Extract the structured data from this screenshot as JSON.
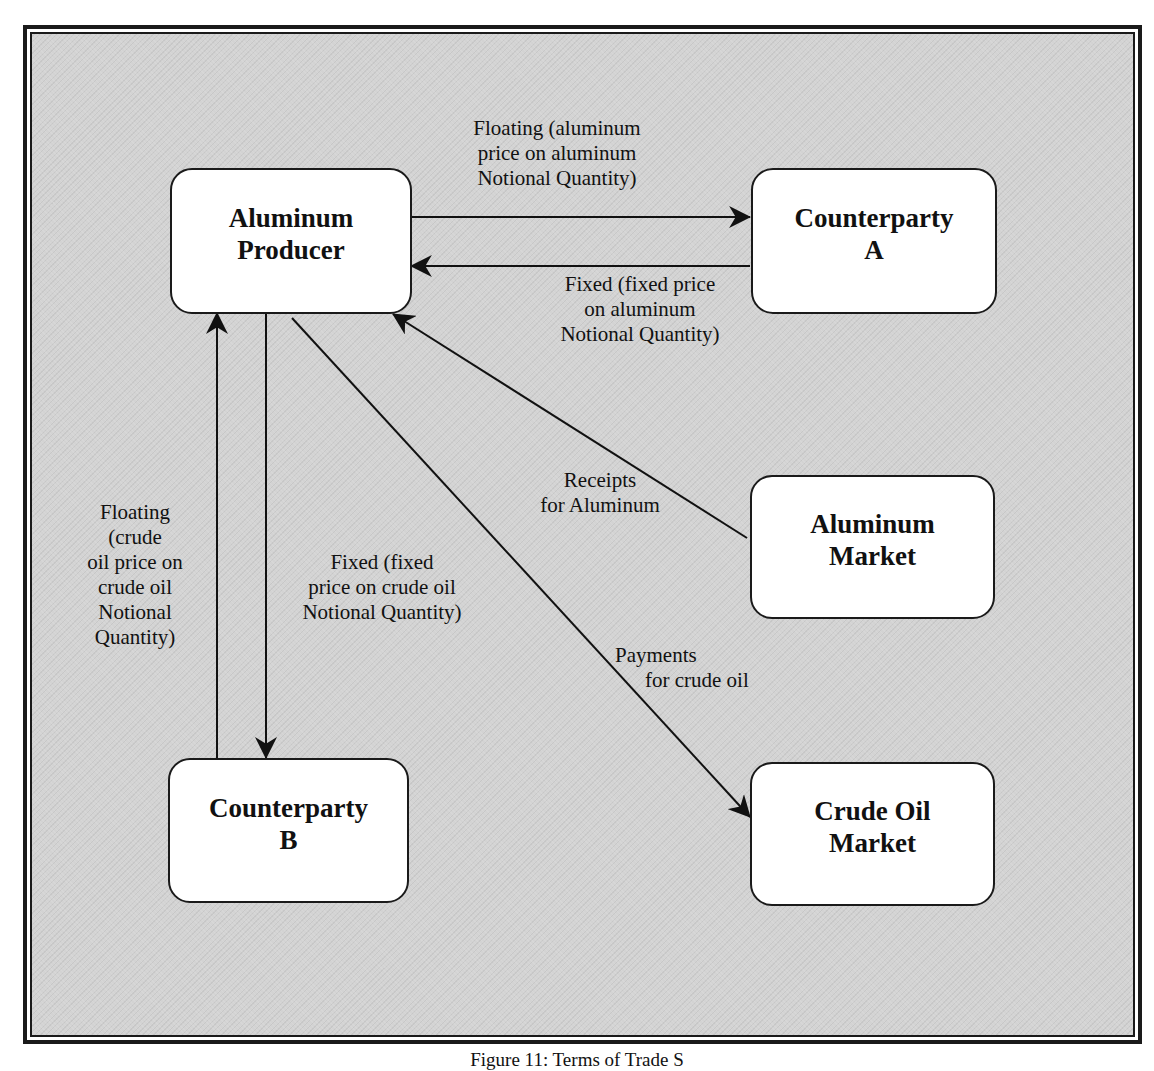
{
  "diagram": {
    "nodes": {
      "aluminum_producer": {
        "line1": "Aluminum",
        "line2": "Producer"
      },
      "counterparty_a": {
        "line1": "Counterparty",
        "line2": "A"
      },
      "aluminum_market": {
        "line1": "Aluminum",
        "line2": "Market"
      },
      "counterparty_b": {
        "line1": "Counterparty",
        "line2": "B"
      },
      "crude_oil_market": {
        "line1": "Crude Oil",
        "line2": "Market"
      }
    },
    "edges": {
      "floating_aluminum": {
        "from": "Aluminum Producer",
        "to": "Counterparty A",
        "lines": [
          "Floating (aluminum",
          "price on aluminum",
          "Notional Quantity)"
        ]
      },
      "fixed_aluminum": {
        "from": "Counterparty A",
        "to": "Aluminum Producer",
        "lines": [
          "Fixed (fixed price",
          "on aluminum",
          "Notional Quantity)"
        ]
      },
      "receipts_aluminum": {
        "from": "Aluminum Market",
        "to": "Aluminum Producer",
        "lines": [
          "Receipts",
          "for Aluminum"
        ]
      },
      "floating_crude": {
        "from": "Counterparty B",
        "to": "Aluminum Producer",
        "lines": [
          "Floating",
          "(crude",
          "oil price on",
          "crude oil",
          "Notional",
          "Quantity)"
        ]
      },
      "fixed_crude": {
        "from": "Aluminum Producer",
        "to": "Counterparty B",
        "lines": [
          "Fixed (fixed",
          "price on crude oil",
          "Notional Quantity)"
        ]
      },
      "payments_crude": {
        "from": "Aluminum Producer",
        "to": "Crude Oil Market",
        "lines": [
          "Payments",
          "for crude oil"
        ]
      }
    },
    "caption": "Figure 11: Terms of Trade S"
  }
}
